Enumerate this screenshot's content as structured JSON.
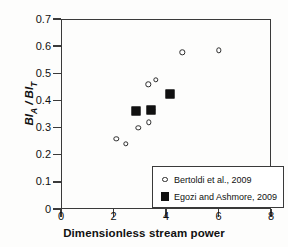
{
  "chart_data": {
    "type": "scatter",
    "title": "",
    "xlabel": "Dimensionless stream power",
    "ylabel": "BI_A / BI_T",
    "ylabel_parts": {
      "base1": "BI",
      "sub1": "A",
      "separator": " / ",
      "base2": "BI",
      "sub2": "T"
    },
    "xlim": [
      0,
      8
    ],
    "ylim": [
      0,
      0.7
    ],
    "xticks": [
      0,
      2,
      4,
      6,
      8
    ],
    "xtick_labels": [
      "0",
      "2",
      "4",
      "6",
      "8"
    ],
    "yticks": [
      0,
      0.1,
      0.2,
      0.3,
      0.4,
      0.5,
      0.6,
      0.7
    ],
    "ytick_labels": [
      "0",
      "0.1",
      "0.2",
      "0.3",
      "0.4",
      "0.5",
      "0.6",
      "0.7"
    ],
    "grid": false,
    "legend_position": "lower-right",
    "series": [
      {
        "name": "Bertoldi et al., 2009",
        "marker": "open-circle",
        "color": "#2b2b2b",
        "points": [
          {
            "x": 2.1,
            "y": 0.258
          },
          {
            "x": 2.48,
            "y": 0.24
          },
          {
            "x": 2.95,
            "y": 0.3
          },
          {
            "x": 3.35,
            "y": 0.32
          },
          {
            "x": 3.5,
            "y": 0.365
          },
          {
            "x": 3.33,
            "y": 0.46
          },
          {
            "x": 3.62,
            "y": 0.475
          },
          {
            "x": 4.62,
            "y": 0.577
          },
          {
            "x": 6.0,
            "y": 0.585
          }
        ]
      },
      {
        "name": "Egozi and Ashmore, 2009",
        "marker": "filled-square",
        "color": "#111111",
        "points": [
          {
            "x": 2.86,
            "y": 0.36
          },
          {
            "x": 3.44,
            "y": 0.365
          },
          {
            "x": 4.16,
            "y": 0.425
          }
        ]
      }
    ]
  },
  "legend": {
    "entries": [
      {
        "label": "Bertoldi et al., 2009",
        "marker": "open-circle"
      },
      {
        "label": "Egozi and Ashmore, 2009",
        "marker": "filled-square"
      }
    ]
  }
}
